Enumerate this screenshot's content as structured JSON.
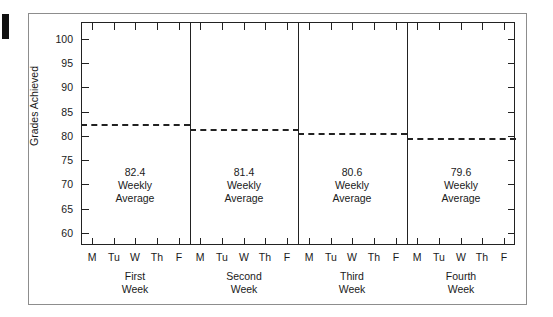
{
  "chart_data": {
    "type": "line",
    "title": "",
    "subtitle": "",
    "xlabel": "",
    "ylabel": "Grades Achieved",
    "ylim": [
      57.5,
      103.5
    ],
    "yticks": [
      60,
      65,
      70,
      75,
      80,
      85,
      90,
      95,
      100
    ],
    "ytick_labels": [
      "60",
      "65",
      "70",
      "75",
      "80",
      "85",
      "90",
      "95",
      "100"
    ],
    "grid": false,
    "legend": "none",
    "x_categories": [
      "M",
      "Tu",
      "W",
      "Th",
      "F",
      "M",
      "Tu",
      "W",
      "Th",
      "F",
      "M",
      "Tu",
      "W",
      "Th",
      "F",
      "M",
      "Tu",
      "W",
      "Th",
      "F"
    ],
    "groups": [
      {
        "label_line1": "First",
        "label_line2": "Week",
        "average": 82.4,
        "days": [
          "M",
          "Tu",
          "W",
          "Th",
          "F"
        ]
      },
      {
        "label_line1": "Second",
        "label_line2": "Week",
        "average": 81.4,
        "days": [
          "M",
          "Tu",
          "W",
          "Th",
          "F"
        ]
      },
      {
        "label_line1": "Third",
        "label_line2": "Week",
        "average": 80.6,
        "days": [
          "M",
          "Tu",
          "W",
          "Th",
          "F"
        ]
      },
      {
        "label_line1": "Fourth",
        "label_line2": "Week",
        "average": 79.6,
        "days": [
          "M",
          "Tu",
          "W",
          "Th",
          "F"
        ]
      }
    ],
    "series": [
      {
        "name": "Weekly Average",
        "style": "dashed-step",
        "values": [
          82.4,
          81.4,
          80.6,
          79.6
        ]
      }
    ],
    "annotations": [
      {
        "value": "82.4",
        "line2": "Weekly",
        "line3": "Average"
      },
      {
        "value": "81.4",
        "line2": "Weekly",
        "line3": "Average"
      },
      {
        "value": "80.6",
        "line2": "Weekly",
        "line3": "Average"
      },
      {
        "value": "79.6",
        "line2": "Weekly",
        "line3": "Average"
      }
    ],
    "colors": {
      "axis": "#222222",
      "series": "#222222",
      "frame": "#8d8d8d",
      "background": "#ffffff",
      "text": "#1a1a1a"
    }
  },
  "axis": {
    "y_title": "Grades Achieved",
    "y_labels": [
      "100",
      "95",
      "90",
      "85",
      "80",
      "75",
      "70",
      "65",
      "60"
    ]
  },
  "days": {
    "w1": [
      "M",
      "Tu",
      "W",
      "Th",
      "F"
    ],
    "w2": [
      "M",
      "Tu",
      "W",
      "Th",
      "F"
    ],
    "w3": [
      "M",
      "Tu",
      "W",
      "Th",
      "F"
    ],
    "w4": [
      "M",
      "Tu",
      "W",
      "Th",
      "F"
    ]
  },
  "notes": [
    {
      "value": "82.4",
      "l2": "Weekly",
      "l3": "Average"
    },
    {
      "value": "81.4",
      "l2": "Weekly",
      "l3": "Average"
    },
    {
      "value": "80.6",
      "l2": "Weekly",
      "l3": "Average"
    },
    {
      "value": "79.6",
      "l2": "Weekly",
      "l3": "Average"
    }
  ],
  "captions": [
    {
      "l1": "First",
      "l2": "Week"
    },
    {
      "l1": "Second",
      "l2": "Week"
    },
    {
      "l1": "Third",
      "l2": "Week"
    },
    {
      "l1": "Fourth",
      "l2": "Week"
    }
  ]
}
